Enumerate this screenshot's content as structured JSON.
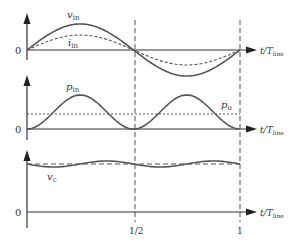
{
  "figure": {
    "type": "waveform-diagram",
    "colors": {
      "line": "#555555",
      "axis": "#333333",
      "text": "#333333",
      "background": "#ffffff"
    },
    "x_axis": {
      "label_main": "t/T",
      "label_sub": "line",
      "ticks": [
        "1/2",
        "1"
      ]
    },
    "panels": [
      {
        "id": "panel-1",
        "origin_label": "0",
        "curves": [
          {
            "name": "v_in",
            "label": "v",
            "sub": "in",
            "style": "solid",
            "desc": "sinusoid, one full period, amplitude 1"
          },
          {
            "name": "i_in",
            "label": "i",
            "sub": "in",
            "style": "dashed",
            "desc": "sinusoid in phase, amplitude ~0.58"
          }
        ]
      },
      {
        "id": "panel-2",
        "origin_label": "0",
        "curves": [
          {
            "name": "p_in",
            "label": "p",
            "sub": "in",
            "style": "solid",
            "desc": "sin^2, peaks at t=1/4 and t=3/4"
          },
          {
            "name": "p_o",
            "label": "p",
            "sub": "o",
            "style": "dotted",
            "desc": "constant at half of p_in peak"
          }
        ]
      },
      {
        "id": "panel-3",
        "origin_label": "0",
        "curves": [
          {
            "name": "v_c",
            "label": "v",
            "sub": "c",
            "style": "solid",
            "desc": "small ripple at twice line frequency around DC mean"
          },
          {
            "name": "v_c_mean",
            "label": "",
            "sub": "",
            "style": "dashed",
            "desc": "DC mean level"
          }
        ]
      }
    ]
  },
  "chart_data": {
    "type": "line",
    "title": "",
    "xlabel": "t/T_line",
    "x_ticks": [
      "1/2",
      "1"
    ],
    "xlim": [
      0,
      1
    ],
    "grid": false,
    "vertical_markers": [
      0.5,
      1
    ],
    "series": [
      {
        "panel": 1,
        "name": "v_in",
        "style": "solid",
        "x": [
          0,
          0.125,
          0.25,
          0.375,
          0.5,
          0.625,
          0.75,
          0.875,
          1
        ],
        "values": [
          0,
          0.71,
          1,
          0.71,
          0,
          -0.71,
          -1,
          -0.71,
          0
        ]
      },
      {
        "panel": 1,
        "name": "i_in",
        "style": "dashed",
        "x": [
          0,
          0.125,
          0.25,
          0.375,
          0.5,
          0.625,
          0.75,
          0.875,
          1
        ],
        "values": [
          0,
          0.41,
          0.58,
          0.41,
          0,
          -0.41,
          -0.58,
          -0.41,
          0
        ]
      },
      {
        "panel": 2,
        "name": "p_in",
        "style": "solid",
        "x": [
          0,
          0.125,
          0.25,
          0.375,
          0.5,
          0.625,
          0.75,
          0.875,
          1
        ],
        "values": [
          0,
          0.5,
          1,
          0.5,
          0,
          0.5,
          1,
          0.5,
          0
        ]
      },
      {
        "panel": 2,
        "name": "p_o",
        "style": "dotted",
        "x": [
          0,
          1
        ],
        "values": [
          0.5,
          0.5
        ]
      },
      {
        "panel": 3,
        "name": "v_c",
        "style": "solid",
        "x": [
          0,
          0.125,
          0.25,
          0.375,
          0.5,
          0.625,
          0.75,
          0.875,
          1
        ],
        "values": [
          1,
          0.95,
          1,
          1.05,
          1,
          0.95,
          1,
          1.05,
          1
        ]
      },
      {
        "panel": 3,
        "name": "v_c_mean",
        "style": "dashed",
        "x": [
          0,
          1
        ],
        "values": [
          1,
          1
        ]
      }
    ]
  }
}
